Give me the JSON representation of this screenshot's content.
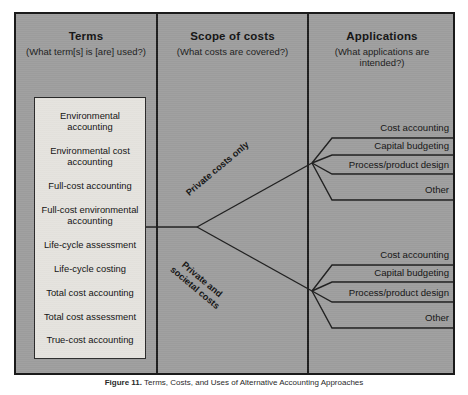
{
  "figure": {
    "caption_label": "Figure 11.",
    "caption_text": "Terms, Costs, and Uses of Alternative Accounting Approaches"
  },
  "columns": [
    {
      "id": "terms",
      "title": "Terms",
      "subtitle": "(What term[s] is [are] used?)"
    },
    {
      "id": "scope",
      "title": "Scope of costs",
      "subtitle": "(What costs are covered?)"
    },
    {
      "id": "applications",
      "title": "Applications",
      "subtitle": "(What applications are intended?)"
    }
  ],
  "terms": [
    "Environmental accounting",
    "Environmental cost accounting",
    "Full-cost accounting",
    "Full-cost environmental accounting",
    "Life-cycle assessment",
    "Life-cycle costing",
    "Total cost accounting",
    "Total cost assessment",
    "True-cost accounting"
  ],
  "branches": [
    {
      "id": "private-only",
      "label": "Private costs only"
    },
    {
      "id": "private-societal",
      "label": "Private and societal costs"
    }
  ],
  "applications": {
    "upper": [
      "Cost accounting",
      "Capital budgeting",
      "Process/product design",
      "Other"
    ],
    "lower": [
      "Cost accounting",
      "Capital budgeting",
      "Process/product design",
      "Other"
    ]
  },
  "colors": {
    "panel_background": "#9f9f9f",
    "frame_border": "#1a1a1a",
    "terms_box_background": "#e9e7e2",
    "line": "#1f1f1f",
    "text": "#141414"
  }
}
